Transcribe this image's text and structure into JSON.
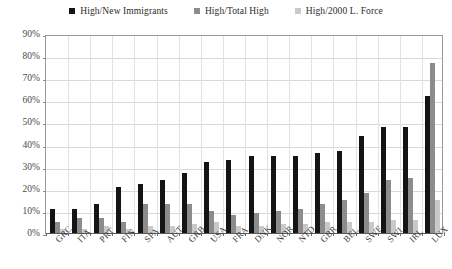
{
  "chart_data": {
    "type": "bar",
    "title": "",
    "subtitle": "",
    "xlabel": "",
    "ylabel": "",
    "ylim": [
      0,
      90
    ],
    "ytick_labels": [
      "0%",
      "10%",
      "20%",
      "30%",
      "40%",
      "50%",
      "60%",
      "70%",
      "80%",
      "90%"
    ],
    "ytick_values": [
      0,
      10,
      20,
      30,
      40,
      50,
      60,
      70,
      80,
      90
    ],
    "grid": true,
    "legend_position": "top-center",
    "categories": [
      "GRC",
      "ITA",
      "PRT",
      "FIN",
      "SPA",
      "AUT",
      "GRB",
      "USA",
      "FRA",
      "DNK",
      "NOR",
      "NTD",
      "GBR",
      "BEL",
      "SWE",
      "SWI",
      "IRL",
      "LUX"
    ],
    "series": [
      {
        "name": "High/New Immigrants",
        "color": "#141414",
        "values": [
          11,
          11,
          13,
          21,
          22,
          24,
          27,
          32,
          33,
          35,
          35,
          35,
          36,
          37,
          44,
          48,
          48,
          62
        ]
      },
      {
        "name": "High/Total High",
        "color": "#8c8c8c",
        "values": [
          5,
          7,
          7,
          5,
          13,
          13,
          13,
          10,
          8,
          9,
          10,
          11,
          13,
          15,
          18,
          24,
          25,
          77
        ]
      },
      {
        "name": "High/2000 L. Force",
        "color": "#c9c9c9",
        "values": [
          2,
          2,
          3,
          2,
          3,
          3,
          4,
          5,
          3,
          3,
          4,
          4,
          5,
          5,
          5,
          6,
          6,
          15
        ]
      }
    ]
  },
  "legend": {
    "entries": [
      {
        "label": "High/New Immigrants"
      },
      {
        "label": "High/Total High"
      },
      {
        "label": "High/2000 L. Force"
      }
    ]
  }
}
